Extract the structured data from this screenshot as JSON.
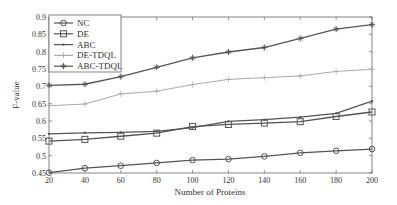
{
  "chart_data": {
    "type": "line",
    "title": "",
    "xlabel": "Number of Proteins",
    "ylabel": "F-value",
    "x": [
      20,
      40,
      60,
      80,
      100,
      120,
      140,
      160,
      180,
      200
    ],
    "xlim": [
      20,
      200
    ],
    "ylim": [
      0.45,
      0.9
    ],
    "xticks": [
      20,
      40,
      60,
      80,
      100,
      120,
      140,
      160,
      180,
      200
    ],
    "xtick_labels": [
      "20",
      "40",
      "60",
      "80",
      "100",
      "120",
      "140",
      "160",
      "180",
      "200"
    ],
    "yticks": [
      0.45,
      0.5,
      0.55,
      0.6,
      0.65,
      0.7,
      0.75,
      0.8,
      0.85,
      0.9
    ],
    "ytick_labels": [
      "0.45",
      "0.5",
      "0.55",
      "0.6",
      "0.65",
      "0.7",
      "0.75",
      "0.8",
      "0.85",
      "0.9"
    ],
    "grid": false,
    "legend_position": "top-left",
    "series": [
      {
        "name": "NC",
        "marker": "circle",
        "color": "#555555",
        "values": [
          0.451,
          0.464,
          0.471,
          0.479,
          0.487,
          0.49,
          0.498,
          0.508,
          0.514,
          0.519
        ]
      },
      {
        "name": "DE",
        "marker": "square",
        "color": "#555555",
        "values": [
          0.542,
          0.547,
          0.556,
          0.565,
          0.584,
          0.59,
          0.594,
          0.598,
          0.613,
          0.626
        ]
      },
      {
        "name": "ABC",
        "marker": "dot",
        "color": "#555555",
        "values": [
          0.563,
          0.566,
          0.567,
          0.57,
          0.581,
          0.599,
          0.604,
          0.611,
          0.622,
          0.657
        ]
      },
      {
        "name": "DE-TDQL",
        "marker": "plus",
        "color": "#aaaaaa",
        "values": [
          0.644,
          0.649,
          0.678,
          0.686,
          0.705,
          0.72,
          0.725,
          0.73,
          0.743,
          0.749
        ]
      },
      {
        "name": "ABC-TDQL",
        "marker": "star",
        "color": "#555555",
        "values": [
          0.703,
          0.706,
          0.728,
          0.755,
          0.782,
          0.799,
          0.812,
          0.838,
          0.865,
          0.878
        ]
      }
    ]
  }
}
